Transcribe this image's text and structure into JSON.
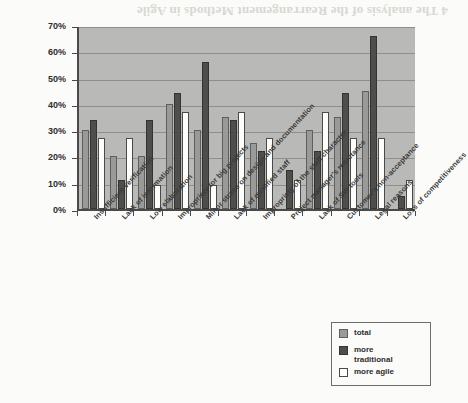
{
  "chart_data": {
    "type": "bar",
    "title": "",
    "xlabel": "",
    "ylabel": "",
    "ylim": [
      0,
      70
    ],
    "ytick_labels": [
      "0%",
      "10%",
      "20%",
      "30%",
      "40%",
      "50%",
      "60%",
      "70%"
    ],
    "ytick_values": [
      0,
      10,
      20,
      30,
      40,
      50,
      60,
      70
    ],
    "grid": true,
    "legend_position": "bottom-right",
    "categories": [
      "Insufficient verification",
      "Lack of information",
      "Low elaboration",
      "Impropriety for big projects",
      "Minor stress on design and documentation",
      "Lack of qualified staff",
      "Impropriety of the staff character",
      "Project manager's reluctance",
      "Lack of SW tools",
      "Customer's non-acceptance",
      "Legal reasons",
      "Loss of competitiveness"
    ],
    "series": [
      {
        "name": "total",
        "color": "#9a9a98",
        "values": [
          30,
          20,
          20,
          40,
          30,
          35,
          25,
          0,
          30,
          35,
          45,
          0
        ]
      },
      {
        "name": "more traditional",
        "color": "#4e4e4c",
        "values": [
          34,
          11,
          34,
          44,
          56,
          34,
          22,
          15,
          22,
          44,
          66,
          5
        ]
      },
      {
        "name": "more agile",
        "color": "#fdfdfb",
        "values": [
          27,
          27,
          9,
          37,
          9,
          37,
          27,
          11,
          37,
          27,
          27,
          11
        ]
      }
    ]
  },
  "legend": {
    "items": [
      {
        "label": "total",
        "swatch": "total-swatch"
      },
      {
        "label": "more traditional",
        "swatch": "more-traditional-swatch"
      },
      {
        "label": "more agile",
        "swatch": "more-agile-swatch"
      }
    ]
  },
  "page": {
    "bleed_text": "4 The analysis of the Rearrangement Methods in Agile"
  }
}
